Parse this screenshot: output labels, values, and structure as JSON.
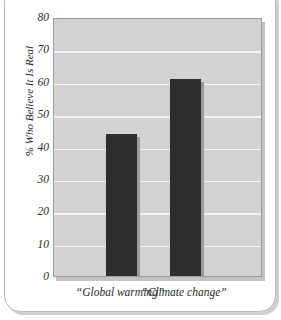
{
  "chart_data": {
    "type": "bar",
    "title": "",
    "xlabel": "",
    "ylabel": "% Who Believe It Is Real",
    "categories": [
      "“Global warming”",
      "“Climate change”"
    ],
    "values": [
      44,
      61
    ],
    "ylim": [
      0,
      80
    ],
    "yticks": [
      0,
      10,
      20,
      30,
      40,
      50,
      60,
      70,
      80
    ],
    "ytick_labels": [
      "0",
      "10",
      "20",
      "30",
      "40",
      "50",
      "60",
      "70",
      "80"
    ],
    "grid": true,
    "legend": false,
    "colors": {
      "bar": "#2e2e2e",
      "plot_background": "#d2d2d2",
      "gridline": "#f2f2f2",
      "plot_border": "#9e9e9e",
      "text": "#2b2b2b",
      "card_background": "#ffffff",
      "card_border": "#b9b9b9",
      "shadow": "#c2c2c2"
    }
  }
}
